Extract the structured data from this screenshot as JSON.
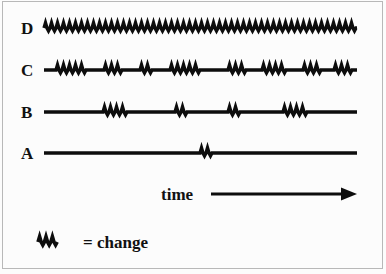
{
  "figure": {
    "background_color": "#fcfcfc",
    "border_color": "#b8b8b8",
    "ink_color": "#0d0d0d"
  },
  "series_labels": {
    "d": "D",
    "c": "C",
    "b": "B",
    "a": "A"
  },
  "axis": {
    "time_label": "time"
  },
  "legend": {
    "text": "= change",
    "symbol_name": "zigzag-change-symbol"
  },
  "chart_data": {
    "type": "line",
    "title": "",
    "xlabel": "time",
    "ylabel": "",
    "grid": false,
    "legend_position": "bottom-left",
    "x_start": 44,
    "x_end": 357,
    "categories": [
      "A",
      "B",
      "C",
      "D"
    ],
    "series": [
      {
        "name": "A",
        "y": 153,
        "change_count": 1,
        "change_level": "very low",
        "bursts": [
          {
            "start": 200,
            "cycles": 2
          }
        ]
      },
      {
        "name": "B",
        "y": 112,
        "change_count": 4,
        "change_level": "low",
        "bursts": [
          {
            "start": 103,
            "cycles": 4
          },
          {
            "start": 175,
            "cycles": 2
          },
          {
            "start": 228,
            "cycles": 2
          },
          {
            "start": 283,
            "cycles": 4
          }
        ]
      },
      {
        "name": "C",
        "y": 70,
        "change_count": 8,
        "change_level": "high",
        "bursts": [
          {
            "start": 56,
            "cycles": 5
          },
          {
            "start": 104,
            "cycles": 3
          },
          {
            "start": 140,
            "cycles": 2
          },
          {
            "start": 170,
            "cycles": 5
          },
          {
            "start": 228,
            "cycles": 3
          },
          {
            "start": 262,
            "cycles": 4
          },
          {
            "start": 303,
            "cycles": 3
          },
          {
            "start": 334,
            "cycles": 3
          }
        ]
      },
      {
        "name": "D",
        "y": 28,
        "change_count": 1,
        "change_level": "continuous",
        "bursts": [
          {
            "start": 44,
            "cycles": 52
          }
        ]
      }
    ],
    "annotations": [
      {
        "name": "time-arrow",
        "text": "time",
        "x": 161,
        "y": 194,
        "arrow_from": 211,
        "arrow_to": 355
      },
      {
        "name": "legend",
        "text": "= change",
        "x": 38,
        "y": 242
      }
    ]
  }
}
